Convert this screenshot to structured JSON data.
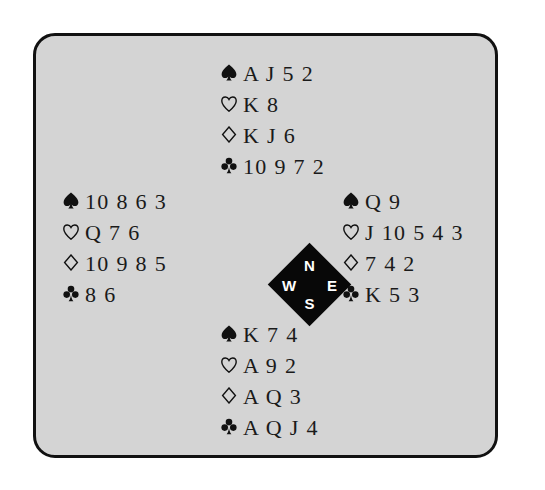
{
  "diagram": {
    "type": "bridge-deal-diagram",
    "suit_order": [
      "spades",
      "hearts",
      "diamonds",
      "clubs"
    ],
    "suit_glyphs": {
      "spades": "♠",
      "hearts": "♡",
      "diamonds": "♢",
      "clubs": "♣"
    },
    "colors": {
      "panel_background": "#d4d4d4",
      "panel_border": "#111111",
      "page_background": "#ffffff",
      "text": "#1a1a1a",
      "compass_fill": "#080808",
      "compass_text": "#ffffff"
    }
  },
  "compass": {
    "north": "N",
    "west": "W",
    "east": "E",
    "south": "S"
  },
  "hands": {
    "north": {
      "position": "North",
      "suits": [
        {
          "suit": "spades",
          "cards": "A J 5 2"
        },
        {
          "suit": "hearts",
          "cards": "K 8"
        },
        {
          "suit": "diamonds",
          "cards": "K J 6"
        },
        {
          "suit": "clubs",
          "cards": "10 9 7 2"
        }
      ]
    },
    "west": {
      "position": "West",
      "suits": [
        {
          "suit": "spades",
          "cards": "10 8 6 3"
        },
        {
          "suit": "hearts",
          "cards": "Q 7 6"
        },
        {
          "suit": "diamonds",
          "cards": "10 9 8 5"
        },
        {
          "suit": "clubs",
          "cards": "8 6"
        }
      ]
    },
    "east": {
      "position": "East",
      "suits": [
        {
          "suit": "spades",
          "cards": "Q 9"
        },
        {
          "suit": "hearts",
          "cards": "J 10 5 4 3"
        },
        {
          "suit": "diamonds",
          "cards": "7 4 2"
        },
        {
          "suit": "clubs",
          "cards": "K 5 3"
        }
      ]
    },
    "south": {
      "position": "South",
      "suits": [
        {
          "suit": "spades",
          "cards": "K 7 4"
        },
        {
          "suit": "hearts",
          "cards": "A 9 2"
        },
        {
          "suit": "diamonds",
          "cards": "A Q 3"
        },
        {
          "suit": "clubs",
          "cards": "A Q J 4"
        }
      ]
    }
  }
}
